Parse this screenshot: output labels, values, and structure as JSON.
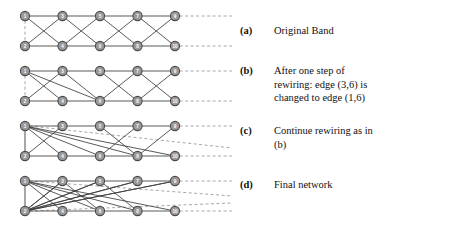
{
  "figure": {
    "node_fill": "#9a9a9a",
    "node_stroke": "#4a4a4a",
    "edge_color": "#3c3c3c",
    "dashed_color": "#8f8f8f",
    "node_radius": 4.6,
    "columns_x": [
      25,
      62.5,
      100,
      137.5,
      175
    ],
    "panels": [
      {
        "id": "a",
        "top_y": 16,
        "bottom_y": 46,
        "nodes_top": [
          "1",
          "3",
          "5",
          "7",
          "9"
        ],
        "nodes_bottom": [
          "2",
          "4",
          "6",
          "8",
          "10"
        ],
        "edges": [
          [
            0,
            0,
            1,
            0
          ],
          [
            1,
            0,
            2,
            0
          ],
          [
            2,
            0,
            3,
            0
          ],
          [
            3,
            0,
            4,
            0
          ],
          [
            0,
            1,
            1,
            1
          ],
          [
            1,
            1,
            2,
            1
          ],
          [
            2,
            1,
            3,
            1
          ],
          [
            3,
            1,
            4,
            1
          ],
          [
            0,
            0,
            1,
            1
          ],
          [
            1,
            0,
            2,
            1
          ],
          [
            2,
            0,
            3,
            1
          ],
          [
            3,
            0,
            4,
            1
          ],
          [
            1,
            0,
            0,
            1
          ],
          [
            2,
            0,
            1,
            1
          ],
          [
            3,
            0,
            2,
            1
          ],
          [
            4,
            0,
            3,
            1
          ]
        ],
        "vertical_dashed": true,
        "vertical_solid": false,
        "dash_right": [
          0,
          1
        ],
        "extra_dashed_right": []
      },
      {
        "id": "b",
        "top_y": 71,
        "bottom_y": 101,
        "nodes_top": [
          "1",
          "3",
          "5",
          "7",
          "9"
        ],
        "nodes_bottom": [
          "2",
          "4",
          "6",
          "8",
          "10"
        ],
        "edges": [
          [
            0,
            0,
            1,
            0
          ],
          [
            1,
            0,
            2,
            0
          ],
          [
            2,
            0,
            3,
            0
          ],
          [
            3,
            0,
            4,
            0
          ],
          [
            0,
            1,
            1,
            1
          ],
          [
            1,
            1,
            2,
            1
          ],
          [
            2,
            1,
            3,
            1
          ],
          [
            3,
            1,
            4,
            1
          ],
          [
            0,
            0,
            1,
            1
          ],
          [
            1,
            0,
            2,
            1
          ],
          [
            2,
            0,
            3,
            1
          ],
          [
            3,
            0,
            4,
            1
          ],
          [
            1,
            0,
            0,
            1
          ],
          [
            3,
            0,
            2,
            1
          ],
          [
            4,
            0,
            3,
            1
          ],
          [
            0,
            0,
            2,
            1
          ]
        ],
        "vertical_dashed": true,
        "vertical_solid": false,
        "dash_right": [
          0,
          1
        ],
        "extra_dashed_right": []
      },
      {
        "id": "c",
        "top_y": 126,
        "bottom_y": 156,
        "nodes_top": [
          "1",
          "3",
          "5",
          "7",
          "9"
        ],
        "nodes_bottom": [
          "2",
          "4",
          "6",
          "8",
          "10"
        ],
        "edges": [
          [
            0,
            0,
            1,
            0
          ],
          [
            1,
            0,
            2,
            0
          ],
          [
            2,
            0,
            3,
            0
          ],
          [
            3,
            0,
            4,
            0
          ],
          [
            0,
            1,
            1,
            1
          ],
          [
            1,
            1,
            2,
            1
          ],
          [
            2,
            1,
            3,
            1
          ],
          [
            3,
            1,
            4,
            1
          ],
          [
            0,
            0,
            1,
            1
          ],
          [
            0,
            0,
            2,
            1
          ],
          [
            0,
            0,
            3,
            1
          ],
          [
            0,
            0,
            4,
            1
          ],
          [
            1,
            0,
            0,
            1
          ],
          [
            3,
            0,
            2,
            1
          ],
          [
            4,
            0,
            3,
            1
          ],
          [
            2,
            0,
            3,
            1
          ]
        ],
        "vertical_dashed": false,
        "vertical_solid": true,
        "dash_right": [
          0,
          1
        ],
        "extra_dashed_right": [
          {
            "from_col": 0,
            "from_row": 0,
            "y_end": 148
          }
        ]
      },
      {
        "id": "d",
        "top_y": 181,
        "bottom_y": 211,
        "nodes_top": [
          "1",
          "3",
          "5",
          "7",
          "9"
        ],
        "nodes_bottom": [
          "2",
          "4",
          "6",
          "8",
          "10"
        ],
        "edges": [
          [
            0,
            0,
            1,
            0
          ],
          [
            1,
            0,
            2,
            0
          ],
          [
            2,
            0,
            3,
            0
          ],
          [
            3,
            0,
            4,
            0
          ],
          [
            0,
            1,
            1,
            1
          ],
          [
            1,
            1,
            2,
            1
          ],
          [
            2,
            1,
            3,
            1
          ],
          [
            3,
            1,
            4,
            1
          ],
          [
            0,
            0,
            1,
            1
          ],
          [
            0,
            0,
            2,
            1
          ],
          [
            0,
            0,
            3,
            1
          ],
          [
            0,
            0,
            4,
            1
          ],
          [
            0,
            1,
            1,
            0
          ],
          [
            0,
            1,
            2,
            0
          ],
          [
            0,
            1,
            3,
            0
          ],
          [
            0,
            1,
            4,
            0
          ],
          [
            1,
            0,
            0,
            1
          ],
          [
            2,
            0,
            0,
            1
          ],
          [
            3,
            0,
            0,
            1
          ],
          [
            4,
            0,
            0,
            1
          ],
          [
            1,
            0,
            2,
            1
          ],
          [
            2,
            0,
            3,
            1
          ]
        ],
        "vertical_dashed": false,
        "vertical_solid": true,
        "dash_right": [
          0,
          1
        ],
        "extra_dashed_right": [
          {
            "from_col": 0,
            "from_row": 0,
            "y_end": 196
          },
          {
            "from_col": 0,
            "from_row": 1,
            "y_end": 203
          }
        ]
      }
    ]
  },
  "captions": [
    {
      "label": "(a)",
      "text": "Original Band",
      "top": 24,
      "lines": [
        "Original Band"
      ]
    },
    {
      "label": "(b)",
      "text": "After one step of rewiring: edge (3,6) is changed to edge (1,6)",
      "top": 64,
      "lines": [
        "After one step of",
        "rewiring: edge (3,6) is",
        "changed to edge (1,6)"
      ]
    },
    {
      "label": "(c)",
      "text": "Continue rewiring as in (b)",
      "top": 124,
      "lines": [
        "Continue rewiring as in",
        "(b)"
      ]
    },
    {
      "label": "(d)",
      "text": "Final network",
      "top": 178,
      "lines": [
        "Final network"
      ]
    }
  ]
}
